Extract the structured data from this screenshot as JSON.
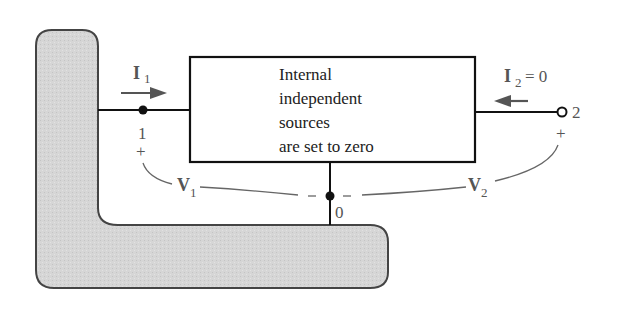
{
  "diagram": {
    "type": "two-port network (port 2 open-circuited)",
    "box": {
      "text_lines": [
        "Internal",
        "independent",
        "sources",
        "are set to zero"
      ]
    },
    "port1": {
      "current_symbol": "I",
      "current_subscript": "1",
      "node_label": "1",
      "plus": "+",
      "voltage_symbol": "V",
      "voltage_subscript": "1"
    },
    "port2": {
      "current_symbol": "I",
      "current_subscript": "2",
      "current_value": "= 0",
      "node_label": "2",
      "plus": "+",
      "voltage_symbol": "V",
      "voltage_subscript": "2"
    },
    "reference_node": {
      "label": "0",
      "minus": "−"
    },
    "colors": {
      "line": "#111111",
      "label": "#555555",
      "source_fill": "#d4d4d4",
      "source_stroke": "#444444",
      "arrow": "#555555"
    }
  }
}
